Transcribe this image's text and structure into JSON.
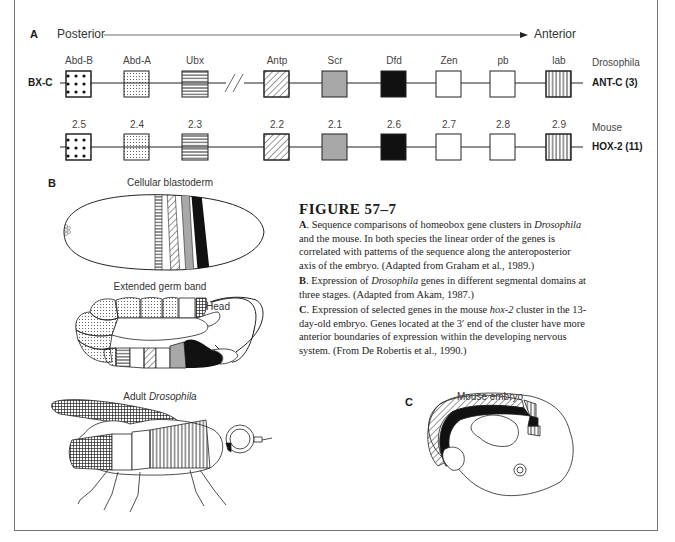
{
  "panel_a": {
    "letter": "A",
    "axis": {
      "left": "Posterior",
      "right": "Anterior"
    },
    "drosophila": {
      "cluster_left": "BX-C",
      "species": "Drosophila",
      "cluster_right": "ANT-C (3)",
      "genes": [
        "Abd-B",
        "Abd-A",
        "Ubx",
        "Antp",
        "Scr",
        "Dfd",
        "Zen",
        "pb",
        "lab"
      ]
    },
    "mouse": {
      "species": "Mouse",
      "cluster_right": "HOX-2 (11)",
      "genes": [
        "2.5",
        "2.4",
        "2.3",
        "2.2",
        "2.1",
        "2.6",
        "2.7",
        "2.8",
        "2.9"
      ]
    },
    "patterns": [
      "large-dots",
      "fine-dots",
      "horizontal-lines",
      "none",
      "diagonal-lines",
      "gray",
      "black",
      "white",
      "white",
      "vertical-lines"
    ]
  },
  "panel_b": {
    "letter": "B",
    "stage1": "Cellular blastoderm",
    "stage2": "Extended germ band",
    "head_label": "Head",
    "stage3_prefix": "Adult ",
    "stage3_italic": "Drosophila"
  },
  "panel_c": {
    "letter": "C",
    "title": "Mouse embryo"
  },
  "caption": {
    "title": "FIGURE 57–7",
    "a_letter": "A",
    "a_text_1": ". Sequence comparisons of homeobox gene clusters in ",
    "a_italic": "Drosophila",
    "a_text_2": " and the mouse. In both species the linear order of the genes is correlated with patterns of the sequence along the anteroposterior axis of the embryo. (Adapted from Graham et al., 1989.)",
    "b_letter": "B",
    "b_text_1": ". Expression of ",
    "b_italic": "Drosophila",
    "b_text_2": " genes in different segmental domains at three stages. (Adapted from Akam, 1987.)",
    "c_letter": "C",
    "c_text_1": ". Expression of selected genes in the mouse ",
    "c_italic": "hox-2",
    "c_text_2": " cluster in the 13-day-old embryo. Genes located at the 3′ end of the cluster have more anterior boundaries of expression within the developing nervous system. (From De Robertis et al., 1990.)"
  },
  "colors": {
    "gray_fill": "#a8a8a8",
    "black_fill": "#111111",
    "line": "#222222",
    "frame": "#777777"
  }
}
